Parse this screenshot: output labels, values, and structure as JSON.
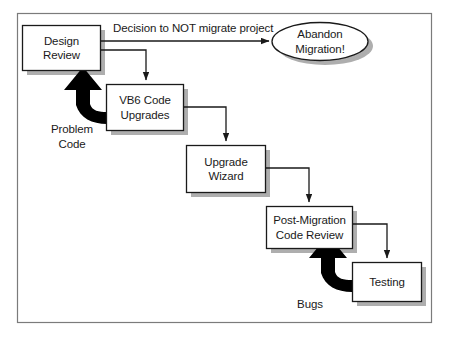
{
  "figure": {
    "background_color": "#ffffff",
    "border_color": "#6e6e6e",
    "node_fill": "#ffffff",
    "node_stroke": "#1a1a1a",
    "shadow_color": "#a8a8a8",
    "connector_color": "#1a1a1a",
    "thick_arrow_color": "#000000"
  },
  "nodes": {
    "design_review": {
      "line1": "Design",
      "line2": "Review",
      "shape": "rectangle"
    },
    "vb6_code_upgrades": {
      "line1": "VB6 Code",
      "line2": "Upgrades",
      "shape": "rectangle"
    },
    "upgrade_wizard": {
      "line1": "Upgrade",
      "line2": "Wizard",
      "shape": "rectangle"
    },
    "post_migration_code_review": {
      "line1": "Post-Migration",
      "line2": "Code Review",
      "shape": "rectangle"
    },
    "testing": {
      "line1": "Testing",
      "line2": "",
      "shape": "rectangle"
    },
    "abandon_migration": {
      "line1": "Abandon",
      "line2": "Migration!",
      "shape": "ellipse"
    }
  },
  "edge_labels": {
    "decision": "Decision to NOT migrate project",
    "problem_code_line1": "Problem",
    "problem_code_line2": "Code",
    "bugs": "Bugs"
  }
}
